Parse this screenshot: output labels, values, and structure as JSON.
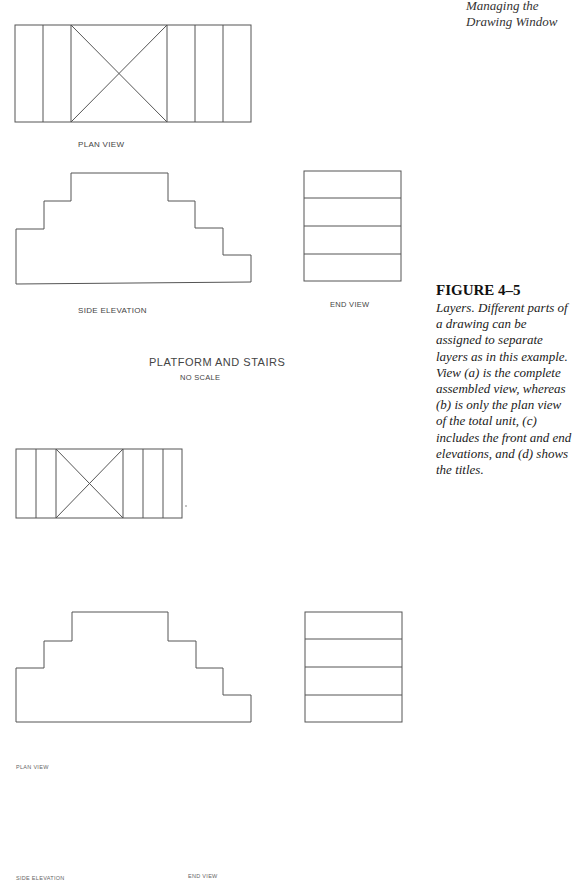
{
  "header": {
    "line1": "Managing the",
    "line2": "Drawing Window"
  },
  "figure": {
    "title": "FIGURE 4–5",
    "caption": "Layers. Different parts of a drawing can be assigned to separate layers as in this example. View (a) is the complete assembled view, whereas (b) is only the plan view of the total unit, (c) includes the front and end elevations, and (d) shows the titles."
  },
  "view_a": {
    "plan_label": "PLAN VIEW",
    "side_label": "SIDE ELEVATION",
    "end_label": "END VIEW",
    "title": "PLATFORM AND STAIRS",
    "subtitle": "NO SCALE"
  },
  "view_d": {
    "plan_label": "PLAN VIEW",
    "side_label": "SIDE ELEVATION",
    "end_label": "END VIEW"
  },
  "colors": {
    "line": "#555555",
    "text": "#222222"
  }
}
